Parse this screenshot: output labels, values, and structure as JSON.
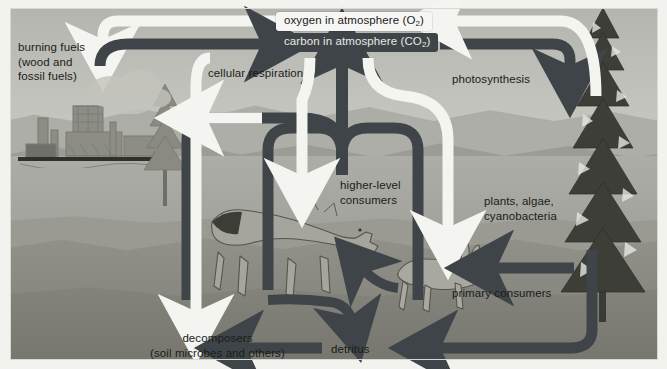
{
  "diagram": {
    "colors": {
      "carbon_arrow": "#3f4448",
      "oxygen_arrow": "#f4f4f1",
      "carbon_box_bg": "#3f4448",
      "carbon_box_text": "#e8e8e6",
      "oxygen_box_bg": "#f6f6f4",
      "oxygen_box_text": "#1b1b1b",
      "sky": "#c3c3bd",
      "ground": "#86867f",
      "soil": "#77776f"
    },
    "reservoirs": [
      {
        "id": "oxygen",
        "label": "oxygen in atmosphere (O",
        "sub": "2",
        "tail": ")"
      },
      {
        "id": "carbon",
        "label": "carbon in atmosphere (CO",
        "sub": "2",
        "tail": ")"
      }
    ],
    "labels": {
      "burning_fuels": "burning fuels\n(wood and\nfossil fuels)",
      "cellular_respiration": "cellular respiration",
      "photosynthesis": "photosynthesis",
      "higher_level_consumers": "higher-level\nconsumers",
      "plants_algae": "plants, algae,\ncyanobacteria",
      "primary_consumers": "primary consumers",
      "decomposers": "decomposers\n(soil microbes and others)",
      "detritus": "detritus"
    },
    "icons": {
      "conifer_large": "tree-icon",
      "conifer_small": "tree-icon",
      "factory": "factory-icon",
      "wolf": "wolf-icon",
      "hare": "hare-icon",
      "smoke": "smoke-icon"
    },
    "flows": [
      {
        "id": "burning-to-carbon",
        "from": "burning fuels",
        "to": "carbon in atmosphere",
        "substance": "carbon"
      },
      {
        "id": "oxygen-to-burning",
        "from": "oxygen in atmosphere",
        "to": "burning fuels",
        "substance": "oxygen"
      },
      {
        "id": "carbon-to-photo",
        "from": "carbon in atmosphere",
        "to": "plants, algae, cyanobacteria",
        "substance": "carbon"
      },
      {
        "id": "photo-to-oxygen",
        "from": "plants, algae, cyanobacteria",
        "to": "oxygen in atmosphere",
        "substance": "oxygen"
      },
      {
        "id": "resp-to-carbon",
        "from": "cellular respiration",
        "to": "carbon in atmosphere",
        "substance": "carbon"
      },
      {
        "id": "oxygen-to-consumers",
        "from": "oxygen in atmosphere",
        "to": "higher-level consumers",
        "substance": "oxygen"
      },
      {
        "id": "oxygen-to-primary",
        "from": "oxygen in atmosphere",
        "to": "primary consumers",
        "substance": "oxygen"
      },
      {
        "id": "oxygen-to-decomp",
        "from": "oxygen in atmosphere",
        "to": "decomposers",
        "substance": "oxygen"
      },
      {
        "id": "plants-to-primary",
        "from": "plants, algae, cyanobacteria",
        "to": "primary consumers",
        "substance": "carbon"
      },
      {
        "id": "primary-to-higher",
        "from": "primary consumers",
        "to": "higher-level consumers",
        "substance": "carbon"
      },
      {
        "id": "consumers-to-detritus",
        "from": "consumers",
        "to": "detritus",
        "substance": "carbon"
      },
      {
        "id": "plants-to-detritus",
        "from": "plants, algae, cyanobacteria",
        "to": "detritus",
        "substance": "carbon"
      },
      {
        "id": "detritus-to-decomp",
        "from": "detritus",
        "to": "decomposers",
        "substance": "carbon"
      },
      {
        "id": "decomp-to-carbon",
        "from": "decomposers",
        "to": "carbon in atmosphere",
        "substance": "carbon"
      }
    ]
  }
}
